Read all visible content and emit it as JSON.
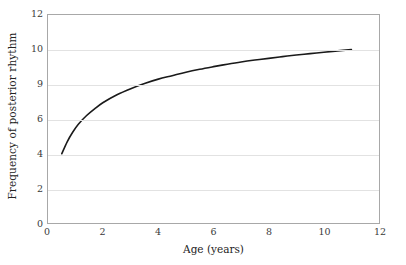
{
  "chart_data": {
    "type": "line",
    "title": "",
    "xlabel": "Age (years)",
    "ylabel": "Frequency of posterior rhythm",
    "xlim": [
      0,
      12
    ],
    "ylim": [
      0,
      12
    ],
    "grid": "horizontal",
    "legend": "none",
    "xticks": [
      0,
      2,
      4,
      6,
      8,
      10,
      12
    ],
    "xtick_labels": [
      "0",
      "2",
      "4",
      "6",
      "8",
      "10",
      "12"
    ],
    "yticks": [
      0,
      2,
      4,
      6,
      8,
      10,
      12
    ],
    "ytick_labels": [
      "0",
      "2",
      "4",
      "6",
      "9",
      "10",
      "12"
    ],
    "line_color": "#1a1a1a",
    "grid_color": "#e2e2e2",
    "frame_color": "#a8a8a8",
    "series": [
      {
        "name": "Posterior rhythm frequency",
        "x": [
          0.5,
          0.7,
          0.9,
          1.1,
          1.4,
          1.7,
          2.0,
          2.5,
          3.0,
          3.5,
          4.0,
          4.5,
          5.0,
          5.5,
          6.0,
          6.5,
          7.0,
          7.5,
          8.0,
          8.5,
          9.0,
          9.5,
          10.0,
          10.5,
          11.0
        ],
        "y": [
          4.0,
          4.7,
          5.25,
          5.7,
          6.2,
          6.6,
          6.95,
          7.4,
          7.75,
          8.05,
          8.3,
          8.5,
          8.7,
          8.87,
          9.02,
          9.16,
          9.29,
          9.4,
          9.5,
          9.6,
          9.69,
          9.77,
          9.85,
          9.93,
          10.0
        ]
      }
    ]
  }
}
